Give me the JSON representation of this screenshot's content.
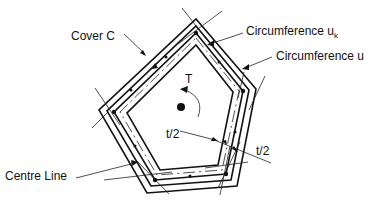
{
  "diagram": {
    "type": "structural cross-section (torsion in hollow polygonal section)",
    "labels": {
      "cover": "Cover C",
      "circumference_uk_main": "Circumference u",
      "circumference_uk_sub": "k",
      "circumference_u": "Circumference u",
      "torque": "T",
      "half_thickness_1": "t/2",
      "half_thickness_2": "t/2",
      "centre_line": "Centre Line"
    },
    "colors": {
      "line": "#111111",
      "background": "#ffffff"
    }
  }
}
